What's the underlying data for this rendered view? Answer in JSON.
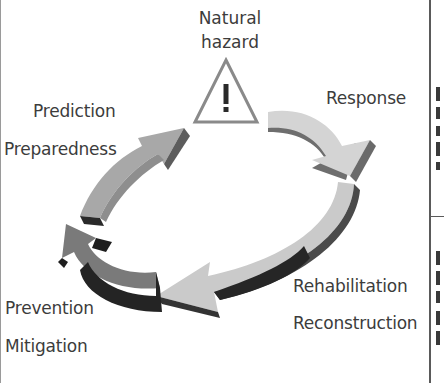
{
  "diagram": {
    "title": "Natural hazard",
    "title_lines": [
      "Natural",
      "hazard"
    ],
    "center_icon": "warning-triangle-icon",
    "phases": [
      {
        "id": "response",
        "labels": [
          "Response"
        ],
        "arrow_color": "#d2d2d2",
        "side_color": "#6e6e6e"
      },
      {
        "id": "recovery",
        "labels": [
          "Rehabilitation",
          "Reconstruction"
        ],
        "arrow_color": "#c8c8c8",
        "side_color": "#2e2e2e"
      },
      {
        "id": "prevention",
        "labels": [
          "Prevention",
          "Mitigation"
        ],
        "arrow_color": "#7a7a7a",
        "side_color": "#252525"
      },
      {
        "id": "preparedness",
        "labels": [
          "Prediction",
          "Preparedness"
        ],
        "arrow_color": "#a6a6a6",
        "side_color": "#5a5a5a"
      }
    ],
    "colors": {
      "text": "#3c3c3c",
      "triangle_stroke": "#8a8a8a",
      "triangle_mark": "#2a2a2a",
      "frame": "#5a5a5a"
    }
  }
}
